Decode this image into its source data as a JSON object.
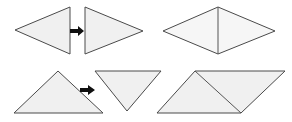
{
  "figure": {
    "background_color": "#ffffff",
    "width": 292,
    "height": 122,
    "fill_color": "#f0f0f0",
    "stroke_color": "#4a4a4a",
    "arrow_color": "#101010"
  },
  "rows": [
    {
      "name": "top-row",
      "operation_label": "",
      "left_group": {
        "name": "two-separate-triangles",
        "shapes": [
          {
            "name": "left-pointing-triangle",
            "icon": "triangle-left-icon",
            "points": "15,30 70,7 70,54"
          },
          {
            "name": "right-pointing-triangle",
            "icon": "triangle-right-icon",
            "points": "85,7 143,31 85,54"
          }
        ],
        "arrow": {
          "name": "transform-arrow-top",
          "icon": "arrow-right-icon",
          "body": "70,29 78,29 78,26 84,31 78,36 78,33 70,33"
        }
      },
      "right_group": {
        "name": "combined-rhombus",
        "shapes": [
          {
            "name": "rhombus-outline",
            "icon": "rhombus-icon",
            "points": "163,31 218,7 275,31 218,54"
          }
        ],
        "seams": [
          {
            "name": "rhombus-seam-vertical",
            "path": "M 218,7 L 218,54"
          }
        ]
      }
    },
    {
      "name": "bottom-row",
      "operation_label": "",
      "left_group": {
        "name": "two-separate-right-triangles",
        "shapes": [
          {
            "name": "upward-triangle",
            "icon": "triangle-up-icon",
            "points": "58,71 103,113 14,113"
          },
          {
            "name": "downward-triangle",
            "icon": "triangle-down-icon",
            "points": "95,71 161,71 127,111"
          }
        ],
        "arrow": {
          "name": "transform-arrow-bottom",
          "icon": "arrow-right-icon",
          "body": "80,88 88,88 88,85 95,90 88,95 88,92 80,92"
        }
      },
      "right_group": {
        "name": "combined-parallelogram",
        "shapes": [
          {
            "name": "parallelogram-outline",
            "icon": "parallelogram-icon",
            "points": "157,113 195,71 285,71 241,113"
          }
        ],
        "seams": [
          {
            "name": "parallelogram-seam-diagonal",
            "path": "M 195,71 L 241,113"
          }
        ]
      }
    }
  ]
}
